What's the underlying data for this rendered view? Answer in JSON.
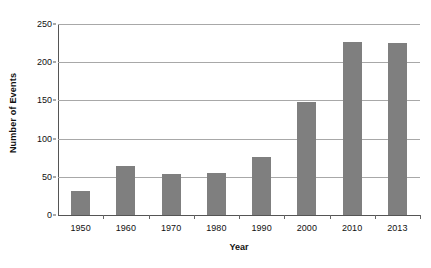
{
  "chart_data": {
    "type": "bar",
    "title": "",
    "xlabel": "Year",
    "ylabel": "Number of Events",
    "categories": [
      "1950",
      "1960",
      "1970",
      "1980",
      "1990",
      "2000",
      "2010",
      "2013"
    ],
    "values": [
      32,
      64,
      54,
      55,
      76,
      148,
      226,
      225
    ],
    "ylim": [
      0,
      250
    ],
    "yticks": [
      0,
      50,
      100,
      150,
      200,
      250
    ],
    "ytick_labels": [
      "0",
      "50",
      "100",
      "150",
      "200",
      "250"
    ],
    "grid": true,
    "legend": false,
    "bar_color": "#7f7f7f",
    "gridline_color": "#a8a8a8",
    "axis_color": "#555555"
  }
}
